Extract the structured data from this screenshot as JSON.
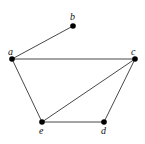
{
  "graph": {
    "nodes": [
      {
        "id": "a",
        "label": "a",
        "x": 12,
        "y": 59,
        "lx": 8,
        "ly": 55
      },
      {
        "id": "b",
        "label": "b",
        "x": 73,
        "y": 26,
        "lx": 70,
        "ly": 20
      },
      {
        "id": "c",
        "label": "c",
        "x": 135,
        "y": 59,
        "lx": 131,
        "ly": 55
      },
      {
        "id": "d",
        "label": "d",
        "x": 104,
        "y": 122,
        "lx": 101,
        "ly": 134
      },
      {
        "id": "e",
        "label": "e",
        "x": 42,
        "y": 122,
        "lx": 39,
        "ly": 134
      }
    ],
    "edges": [
      {
        "from": "a",
        "to": "b"
      },
      {
        "from": "a",
        "to": "c"
      },
      {
        "from": "a",
        "to": "e"
      },
      {
        "from": "e",
        "to": "c"
      },
      {
        "from": "e",
        "to": "d"
      },
      {
        "from": "d",
        "to": "c"
      }
    ]
  }
}
